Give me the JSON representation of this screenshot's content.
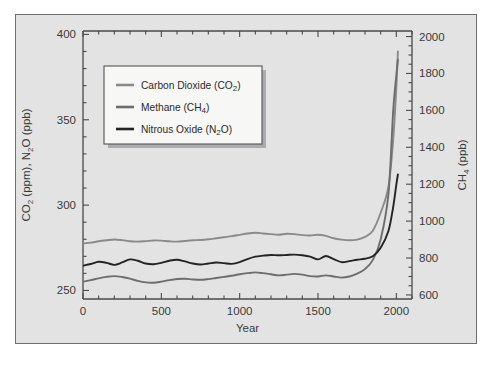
{
  "figure": {
    "background_color": "#e3e3e3",
    "frame_color": "#6e6e70",
    "plot_background": "#e3e3e3"
  },
  "axes": {
    "x": {
      "label": "Year",
      "ticks": [
        0,
        500,
        1000,
        1500,
        2000
      ],
      "tick_labels": [
        "0",
        "500",
        "1000",
        "1500",
        "2000"
      ],
      "range": [
        0,
        2100
      ],
      "minor_tick_step": 100
    },
    "y_left": {
      "label_main": "CO",
      "label_sub1": "2",
      "label_mid": " (ppm), N",
      "label_sub2": "2",
      "label_tail": "O (ppb)",
      "label_plain": "CO2 (ppm), N2O (ppb)",
      "ticks": [
        250,
        300,
        350,
        400
      ],
      "tick_labels": [
        "250",
        "300",
        "350",
        "400"
      ],
      "range": [
        245,
        402
      ],
      "minor_tick_step": 10
    },
    "y_right": {
      "label_main": "CH",
      "label_sub": "4",
      "label_tail": " (ppb)",
      "label_plain": "CH4 (ppb)",
      "ticks": [
        600,
        800,
        1000,
        1200,
        1400,
        1600,
        1800,
        2000
      ],
      "tick_labels": [
        "600",
        "800",
        "1000",
        "1200",
        "1400",
        "1600",
        "1800",
        "2000"
      ],
      "range": [
        578,
        2030
      ],
      "minor_tick_step": 50
    }
  },
  "legend": {
    "position": "upper-left-inset",
    "background": "#f7f7f5",
    "border_color": "#555557",
    "items": [
      {
        "label_a": "Carbon Dioxide (CO",
        "sub": "2",
        "label_b": ")",
        "plain": "Carbon Dioxide (CO2)",
        "color": "#8a8a8c",
        "key": "co2"
      },
      {
        "label_a": "Methane (CH",
        "sub": "4",
        "label_b": ")",
        "plain": "Methane (CH4)",
        "color": "#6d6d70",
        "key": "ch4"
      },
      {
        "label_a": "Nitrous Oxide (N",
        "sub": "2",
        "label_b": "O)",
        "plain": "Nitrous Oxide (N2O)",
        "color": "#232325",
        "key": "n2o"
      }
    ]
  },
  "chart_data": {
    "type": "line",
    "title": "",
    "xlabel": "Year",
    "ylabel": "CO2 (ppm), N2O (ppb)",
    "ylabel_right": "CH4 (ppb)",
    "xlim": [
      0,
      2100
    ],
    "ylim": [
      245,
      402
    ],
    "ylim_right": [
      578,
      2030
    ],
    "grid": false,
    "legend_position": "upper left",
    "x": [
      0,
      50,
      100,
      150,
      200,
      250,
      300,
      350,
      400,
      450,
      500,
      550,
      600,
      650,
      700,
      750,
      800,
      850,
      900,
      950,
      1000,
      1050,
      1100,
      1150,
      1200,
      1250,
      1300,
      1350,
      1400,
      1450,
      1500,
      1550,
      1600,
      1650,
      1700,
      1750,
      1800,
      1850,
      1900,
      1950,
      1980,
      2000,
      2010
    ],
    "series": [
      {
        "name": "Carbon Dioxide (CO2)",
        "key": "co2",
        "axis": "left",
        "unit": "ppm",
        "color": "#8a8a8c",
        "values": [
          277.5,
          278.0,
          278.8,
          279.4,
          279.9,
          279.5,
          278.8,
          278.6,
          278.9,
          279.3,
          279.2,
          278.8,
          278.6,
          279.0,
          279.4,
          279.6,
          280.0,
          280.6,
          281.2,
          281.8,
          282.6,
          283.4,
          283.8,
          283.4,
          283.0,
          282.6,
          283.2,
          283.0,
          282.4,
          282.2,
          282.6,
          282.0,
          280.6,
          279.8,
          279.4,
          279.8,
          281.4,
          285.0,
          295.5,
          311.0,
          338.5,
          369.0,
          390.0
        ]
      },
      {
        "name": "Methane (CH4)",
        "key": "ch4",
        "axis": "right",
        "unit": "ppb",
        "color": "#6d6d70",
        "values": [
          672,
          680,
          690,
          698,
          702,
          697,
          688,
          676,
          668,
          666,
          672,
          680,
          686,
          688,
          684,
          682,
          686,
          692,
          698,
          704,
          712,
          718,
          722,
          718,
          712,
          706,
          710,
          714,
          710,
          702,
          700,
          706,
          700,
          694,
          700,
          716,
          740,
          790,
          900,
          1150,
          1600,
          1790,
          1875
        ]
      },
      {
        "name": "Nitrous Oxide (N2O)",
        "key": "n2o",
        "axis": "left",
        "unit": "ppb",
        "color": "#232325",
        "values": [
          264.5,
          265.5,
          266.8,
          266.2,
          265.0,
          266.4,
          268.2,
          267.4,
          265.8,
          265.4,
          266.2,
          267.4,
          268.0,
          267.0,
          265.8,
          265.2,
          265.8,
          266.4,
          266.0,
          265.6,
          266.6,
          268.4,
          269.8,
          270.4,
          270.8,
          270.6,
          270.8,
          271.0,
          270.6,
          269.8,
          268.2,
          270.2,
          268.4,
          266.6,
          267.2,
          268.0,
          268.6,
          270.0,
          275.0,
          285.0,
          299.0,
          312.0,
          318.0
        ]
      }
    ],
    "annotations": []
  }
}
